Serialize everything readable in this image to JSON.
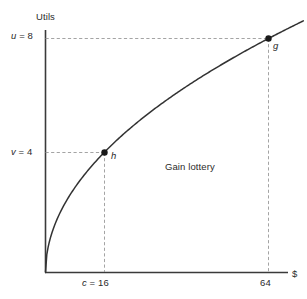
{
  "figure": {
    "background_color": "#ffffff",
    "axis_color": "#3a3a3a",
    "curve_color": "#333333",
    "guide_color": "#9a9a9a",
    "text_color": "#2b2b2b"
  },
  "axes": {
    "y_title": "Utils",
    "x_title": "$",
    "y_ticks": [
      {
        "var": "u",
        "eq": "=",
        "value": "8",
        "label": "u = 8",
        "y_value": 8
      },
      {
        "var": "v",
        "eq": "=",
        "value": "4",
        "label": "v = 4",
        "y_value": 4
      }
    ],
    "x_ticks": [
      {
        "var": "c",
        "eq": "=",
        "value": "16",
        "label": "c = 16",
        "x_value": 16
      },
      {
        "var": "",
        "eq": "",
        "value": "64",
        "label": "64",
        "x_value": 64
      }
    ]
  },
  "points": [
    {
      "name": "h",
      "label": "h",
      "x": 16,
      "y": 4,
      "marker": "filled-circle"
    },
    {
      "name": "g",
      "label": "g",
      "x": 64,
      "y": 8,
      "marker": "filled-circle"
    }
  ],
  "annotations": [
    {
      "name": "region-note",
      "text": "Gain lottery"
    }
  ],
  "chart_data": {
    "type": "line",
    "title": "",
    "subtitle": "",
    "xlabel": "$",
    "ylabel": "Utils",
    "xlim": [
      0,
      74
    ],
    "ylim": [
      0,
      8.8
    ],
    "grid": false,
    "legend": null,
    "series": [
      {
        "name": "utility curve u(x) = sqrt(x)",
        "type": "line",
        "x": [
          0,
          2,
          4,
          6,
          8,
          10,
          12,
          14,
          16,
          20,
          24,
          28,
          32,
          36,
          40,
          44,
          48,
          52,
          56,
          60,
          64
        ],
        "values": [
          0,
          1.414,
          2,
          2.449,
          2.828,
          3.162,
          3.464,
          3.742,
          4,
          4.472,
          4.899,
          5.292,
          5.657,
          6,
          6.325,
          6.633,
          6.928,
          7.211,
          7.483,
          7.746,
          8
        ]
      }
    ],
    "points": [
      {
        "name": "h",
        "label": "h",
        "x": 16,
        "y": 4
      },
      {
        "name": "g",
        "label": "g",
        "x": 64,
        "y": 8
      }
    ],
    "reference_lines": [
      {
        "orientation": "horizontal",
        "value": 8,
        "label": "u = 8",
        "style": "dashed"
      },
      {
        "orientation": "horizontal",
        "value": 4,
        "label": "v = 4",
        "style": "dashed"
      },
      {
        "orientation": "vertical",
        "value": 16,
        "label": "c = 16",
        "style": "dashed"
      },
      {
        "orientation": "vertical",
        "value": 64,
        "label": "64",
        "style": "dashed"
      }
    ],
    "xtick_labels": [
      "c = 16",
      "64"
    ],
    "ytick_labels": [
      "v = 4",
      "u = 8"
    ],
    "annotations": [
      "Gain lottery"
    ]
  }
}
